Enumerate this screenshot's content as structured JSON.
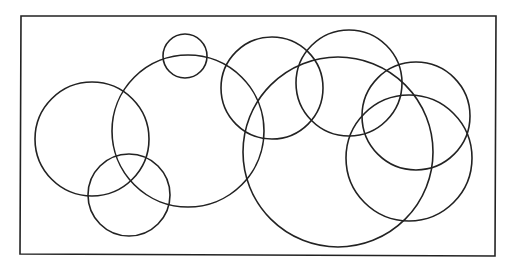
{
  "diagram": {
    "background": "#ffffff",
    "stroke_color": "#222222",
    "frame": {
      "x1": 21,
      "y1": 16,
      "x2": 496,
      "y2": 16,
      "x3": 495,
      "y3": 256,
      "x4": 20,
      "y4": 254,
      "stroke_width": 1.6
    },
    "circles": [
      {
        "id": "circle-small-top",
        "cx": 185,
        "cy": 56,
        "r": 22
      },
      {
        "id": "circle-large-left-center",
        "cx": 188,
        "cy": 131,
        "r": 76
      },
      {
        "id": "circle-mid-top",
        "cx": 272,
        "cy": 88,
        "r": 51
      },
      {
        "id": "circle-upper-right-middle",
        "cx": 349,
        "cy": 83,
        "r": 53
      },
      {
        "id": "circle-large-bottom-center",
        "cx": 338,
        "cy": 152,
        "r": 95
      },
      {
        "id": "circle-right-upper",
        "cx": 416,
        "cy": 116,
        "r": 54
      },
      {
        "id": "circle-right-lower",
        "cx": 409,
        "cy": 158,
        "r": 63
      },
      {
        "id": "circle-left",
        "cx": 92,
        "cy": 139,
        "r": 57
      },
      {
        "id": "circle-bottom-left-small",
        "cx": 129,
        "cy": 195,
        "r": 41
      }
    ],
    "circle_stroke_width": 1.6
  }
}
